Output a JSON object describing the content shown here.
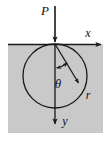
{
  "figure": {
    "background_color": "#ffffff",
    "halfplane_fill": "#c9c9c9",
    "line_color": "#1a1a1a"
  },
  "labels": {
    "load": "P",
    "x_axis": "x",
    "y_axis": "y",
    "theta": "θ",
    "radius": "r"
  },
  "geometry": {
    "halfplane": {
      "x": 8,
      "y": 44,
      "width": 95,
      "height": 89
    },
    "origin": {
      "x": 55,
      "y": 44
    },
    "circle": {
      "cx": 55,
      "cy": 76,
      "r": 32
    },
    "load_arrow": {
      "x1": 55,
      "y1": 6,
      "x2": 55,
      "y2": 44
    },
    "x_axis_arrow": {
      "x1": 55,
      "y1": 44,
      "x2": 105,
      "y2": 44
    },
    "y_axis_arrow": {
      "x1": 55,
      "y1": 44,
      "x2": 55,
      "y2": 129
    },
    "radius_line": {
      "x1": 55,
      "y1": 44,
      "x2": 81,
      "y2": 87
    },
    "theta_arc": {
      "cx": 55,
      "cy": 44,
      "radius": 24,
      "start_deg": 90,
      "end_deg": 58
    }
  },
  "values": {
    "theta_degrees": 31,
    "circle_diameter_px": 64
  }
}
